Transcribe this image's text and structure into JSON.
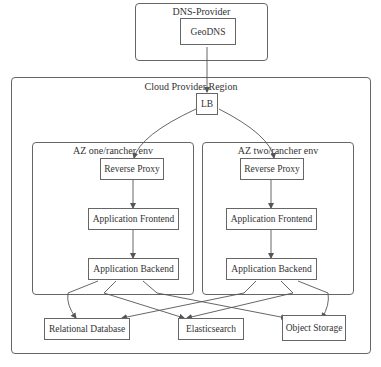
{
  "clusters": {
    "dns_provider": {
      "label": "DNS-Provider"
    },
    "cloud_region": {
      "label": "Cloud Provider Region"
    },
    "az_one": {
      "label": "AZ one/rancher env"
    },
    "az_two": {
      "label": "AZ two/rancher env"
    }
  },
  "nodes": {
    "geodns": "GeoDNS",
    "lb": "LB",
    "az_one": {
      "reverse_proxy": "Reverse Proxy",
      "app_frontend": "Application Frontend",
      "app_backend": "Application Backend"
    },
    "az_two": {
      "reverse_proxy": "Reverse Proxy",
      "app_frontend": "Application Frontend",
      "app_backend": "Application Backend"
    },
    "relational_db": "Relational Database",
    "elasticsearch": "Elasticsearch",
    "object_storage": "Object Storage"
  },
  "edges": [
    [
      "GeoDNS",
      "LB"
    ],
    [
      "LB",
      "AZ one Reverse Proxy"
    ],
    [
      "LB",
      "AZ two Reverse Proxy"
    ],
    [
      "AZ one Reverse Proxy",
      "AZ one Application Frontend"
    ],
    [
      "AZ one Application Frontend",
      "AZ one Application Backend"
    ],
    [
      "AZ two Reverse Proxy",
      "AZ two Application Frontend"
    ],
    [
      "AZ two Application Frontend",
      "AZ two Application Backend"
    ],
    [
      "AZ one Application Backend",
      "Relational Database"
    ],
    [
      "AZ one Application Backend",
      "Elasticsearch"
    ],
    [
      "AZ one Application Backend",
      "Object Storage"
    ],
    [
      "AZ two Application Backend",
      "Relational Database"
    ],
    [
      "AZ two Application Backend",
      "Elasticsearch"
    ],
    [
      "AZ two Application Backend",
      "Object Storage"
    ]
  ],
  "caption": ""
}
